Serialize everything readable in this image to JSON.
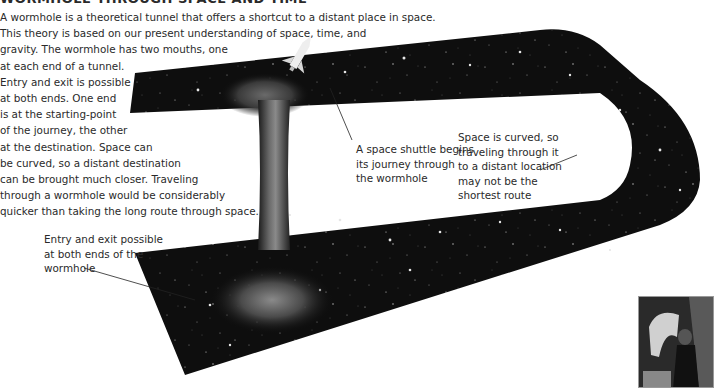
{
  "title": "WORMHOLE THROUGH SPACE AND TIME",
  "intro_lines": [
    "A wormhole is a theoretical tunnel that offers a shortcut to a distant place in space.",
    "This theory is based on our present understanding of space, time, and",
    "gravity. The wormhole has two mouths, one",
    "at each end of a tunnel.",
    "Entry and exit is possible",
    "at both ends. One end",
    "is at the starting-point",
    "of the journey, the other",
    "at the destination. Space can",
    "be curved, so a distant destination",
    "can be brought much closer. Traveling",
    "through a wormhole would be considerably",
    "quicker than taking the long route through space."
  ],
  "labels": {
    "shuttle": [
      "A space shuttle begins",
      "its journey through",
      "the wormhole"
    ],
    "curved": [
      "Space is curved, so",
      "traveling through it",
      "to a distant location",
      "may not be the",
      "shortest route"
    ],
    "entry": [
      "Entry and exit possible",
      "at both ends of the",
      "wormhole"
    ]
  },
  "illustration": {
    "subject": "curved space sheet with wormhole tunnel",
    "space_color": "#0d0d0d",
    "star_color": "#d8d8d8"
  },
  "photo": {
    "subject": "time-travel scene photo (film still)"
  }
}
